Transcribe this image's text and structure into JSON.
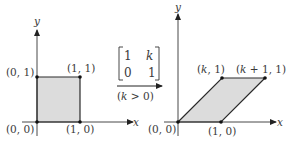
{
  "colors": {
    "line": "#2a2a2a",
    "fill": "#dcdcdc",
    "axis": "#333333",
    "text": "#3a3a3a"
  },
  "left_plot": {
    "x_axis_label": "x",
    "y_axis_label": "y",
    "shape": "unit square",
    "vertices": [
      {
        "label": "(0, 0)",
        "coord": [
          0,
          0
        ]
      },
      {
        "label": "(1, 0)",
        "coord": [
          1,
          0
        ]
      },
      {
        "label": "(1, 1)",
        "coord": [
          1,
          1
        ]
      },
      {
        "label": "(0, 1)",
        "coord": [
          0,
          1
        ]
      }
    ]
  },
  "transform": {
    "matrix": {
      "r1c1": "1",
      "r1c2": "k",
      "r2c1": "0",
      "r2c2": "1"
    },
    "condition_open": "(",
    "condition_var": "k",
    "condition_rest": " > 0)"
  },
  "right_plot": {
    "x_axis_label": "x",
    "y_axis_label": "y",
    "shape": "parallelogram (horizontal shear)",
    "vertices": [
      {
        "label": "(0, 0)",
        "coord": [
          0,
          0
        ]
      },
      {
        "label": "(1, 0)",
        "coord": [
          1,
          0
        ]
      },
      {
        "label_var": "k",
        "label_rest": ", 1)",
        "label": "(k, 1)",
        "coord": [
          "k",
          1
        ]
      },
      {
        "label_var": "k",
        "label_rest": " + 1, 1)",
        "label": "(k + 1, 1)",
        "coord": [
          "k+1",
          1
        ]
      }
    ]
  }
}
